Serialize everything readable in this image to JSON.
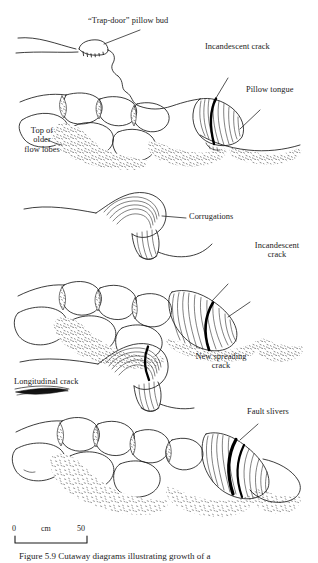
{
  "figure": {
    "caption": "Figure 5.9    Cutaway diagrams illustrating growth of a",
    "caption_label": "Figure 5.9",
    "background_color": "#ffffff",
    "ink_color": "#1a1a1a",
    "crack_color": "#000000"
  },
  "labels": {
    "trap_door": "“Trap-door” pillow bud",
    "incandescent_crack_top": "Incandescent crack",
    "pillow_tongue": "Pillow tongue",
    "top_of_older_flow_lobes_l1": "Top of",
    "top_of_older_flow_lobes_l2": "older",
    "top_of_older_flow_lobes_l3": "flow lobes",
    "corrugations": "Corrugations",
    "incandescent_crack_mid_l1": "Incandescent",
    "incandescent_crack_mid_l2": "crack",
    "new_spreading_crack_l1": "New spreading",
    "new_spreading_crack_l2": "crack",
    "longitudinal_crack": "Longitudinal crack",
    "fault_slivers": "Fault slivers"
  },
  "scale_bar": {
    "left_value": "0",
    "unit": "cm",
    "right_value": "50",
    "length_px": 72
  },
  "stages": [
    {
      "index": 1,
      "name": "trap-door-bud-stage",
      "description": "Small trap-door pillow bud opening on a flow surface"
    },
    {
      "index": 2,
      "name": "pillow-tongue-stage",
      "description": "Pillow tongue extruded with incandescent crack across its nose, over older flow lobes"
    },
    {
      "index": 3,
      "name": "corrugation-stage",
      "description": "Corrugated bud and elongating pillow with incandescent crack"
    },
    {
      "index": 4,
      "name": "fault-sliver-stage",
      "description": "Mature pillow with new spreading crack, longitudinal crack and fault slivers"
    }
  ]
}
